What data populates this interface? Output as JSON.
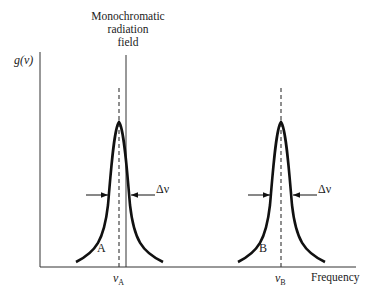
{
  "diagram": {
    "field_label": [
      "Monochromatic",
      "radiation",
      "field"
    ],
    "y_axis_label": "g(ν)",
    "x_axis_label": "Frequency",
    "lines": [
      {
        "name": "A",
        "center_label": "ν",
        "center_sub": "A",
        "width_label": "Δν"
      },
      {
        "name": "B",
        "center_label": "ν",
        "center_sub": "B",
        "width_label": "Δν"
      }
    ],
    "colors": {
      "curve": "#111111",
      "axis": "#333333",
      "dashed": "#444444"
    }
  }
}
